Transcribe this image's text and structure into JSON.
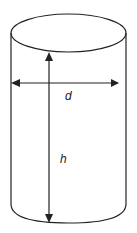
{
  "diagram": {
    "labels": {
      "diameter": "d",
      "height": "h"
    },
    "colors": {
      "stroke": "#222222",
      "background": "#ffffff"
    }
  }
}
